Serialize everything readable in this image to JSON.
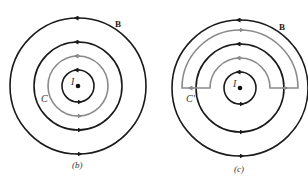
{
  "figure": {
    "colors": {
      "field_line": "#1a1a1a",
      "contour": "#8a8a8a",
      "background": "#ffffff"
    },
    "panels": [
      {
        "id": "b",
        "caption": "(b)",
        "current_label": "I",
        "field_label": "B",
        "contour_label": "C",
        "center": [
          78,
          86
        ],
        "field_circle_radii": [
          16,
          44,
          68
        ],
        "contour": {
          "type": "circle",
          "radius": 30
        }
      },
      {
        "id": "c",
        "caption": "(c)",
        "current_label": "I",
        "field_label": "B",
        "contour_label": "C'",
        "center": [
          240,
          88
        ],
        "field_circle_radii": [
          16,
          44,
          68
        ],
        "contour": {
          "type": "half-annulus",
          "inner_radius": 30,
          "outer_radius": 58
        }
      }
    ]
  }
}
